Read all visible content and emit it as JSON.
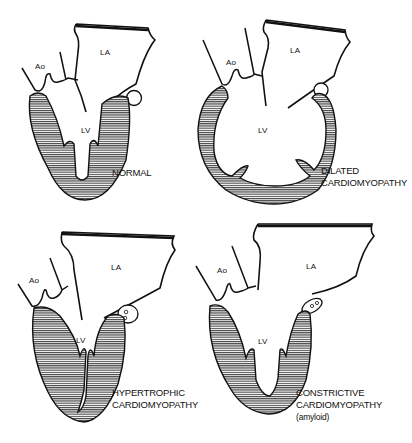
{
  "diagram": {
    "panels": [
      {
        "id": "normal",
        "caption_lines": [
          "NORMAL"
        ],
        "labels": {
          "aorta": "Ao",
          "left_atrium": "LA",
          "left_ventricle": "LV"
        }
      },
      {
        "id": "dilated",
        "caption_lines": [
          "DILATED",
          "CARDIOMYOPATHY"
        ],
        "labels": {
          "aorta": "Ao",
          "left_atrium": "LA",
          "left_ventricle": "LV"
        }
      },
      {
        "id": "hypertrophic",
        "caption_lines": [
          "HYPERTROPHIC",
          "CARDIOMYOPATHY"
        ],
        "labels": {
          "aorta": "Ao",
          "left_atrium": "LA",
          "left_ventricle": "LV"
        }
      },
      {
        "id": "constrictive",
        "caption_lines": [
          "CONSTRICTIVE",
          "CARDIOMYOPATHY",
          "(amyloid)"
        ],
        "labels": {
          "aorta": "Ao",
          "left_atrium": "LA",
          "left_ventricle": "LV"
        }
      }
    ],
    "colors": {
      "ink": "#111111",
      "background": "#ffffff"
    }
  }
}
